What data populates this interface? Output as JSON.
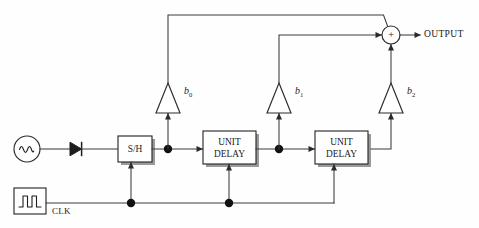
{
  "diagram": {
    "type": "block-diagram",
    "canvas": {
      "width": 479,
      "height": 228
    },
    "colors": {
      "background": "#fefefe",
      "wire": "#3a3a3a",
      "outline": "#2b2b2b",
      "shadow": "#9a9a9a",
      "node": "#111111",
      "text": "#1a1a1a"
    },
    "blocks": {
      "sample_hold": {
        "label": "S/H",
        "x": 118,
        "y": 136,
        "w": 34,
        "h": 26
      },
      "unit_delay_1": {
        "label_line1": "UNIT",
        "label_line2": "DELAY",
        "x": 203,
        "y": 131,
        "w": 53,
        "h": 33
      },
      "unit_delay_2": {
        "label_line1": "UNIT",
        "label_line2": "DELAY",
        "x": 315,
        "y": 131,
        "w": 53,
        "h": 33
      }
    },
    "sources": {
      "signal_source": {
        "name": "sine-source",
        "cx": 27,
        "cy": 149,
        "r": 13
      },
      "clock_source": {
        "name": "clock-source",
        "label": "CLK",
        "x": 14,
        "y": 188,
        "w": 32,
        "h": 26
      }
    },
    "diode": {
      "name": "diode",
      "x": 70,
      "y": 149
    },
    "amplifiers": [
      {
        "id": "b0",
        "label": "b",
        "subscript": "0",
        "cx": 168,
        "cy": 99
      },
      {
        "id": "b1",
        "label": "b",
        "subscript": "1",
        "cx": 279,
        "cy": 99
      },
      {
        "id": "b2",
        "label": "b",
        "subscript": "2",
        "cx": 391,
        "cy": 99
      }
    ],
    "summing_junction": {
      "symbol": "+",
      "cx": 391,
      "cy": 35,
      "r": 9
    },
    "output": {
      "label": "OUTPUT",
      "x": 424,
      "y": 35
    },
    "junction_nodes": [
      {
        "name": "node-sh-out",
        "cx": 168,
        "cy": 149
      },
      {
        "name": "node-delay1-out",
        "cx": 279,
        "cy": 149
      },
      {
        "name": "node-clk-sh",
        "cx": 131,
        "cy": 203
      },
      {
        "name": "node-clk-delay1",
        "cx": 229,
        "cy": 203
      }
    ],
    "signal_path": [
      "signal source",
      "diode",
      "S/H",
      "UNIT DELAY",
      "UNIT DELAY"
    ],
    "tap_paths": [
      {
        "from": "node-sh-out",
        "amplifier": "b0",
        "to": "summing_junction"
      },
      {
        "from": "node-delay1-out",
        "amplifier": "b1",
        "to": "summing_junction"
      },
      {
        "from": "unit_delay_2_out",
        "amplifier": "b2",
        "to": "summing_junction"
      }
    ],
    "clock_fanout": [
      "S/H",
      "UNIT DELAY 1",
      "UNIT DELAY 2"
    ]
  }
}
